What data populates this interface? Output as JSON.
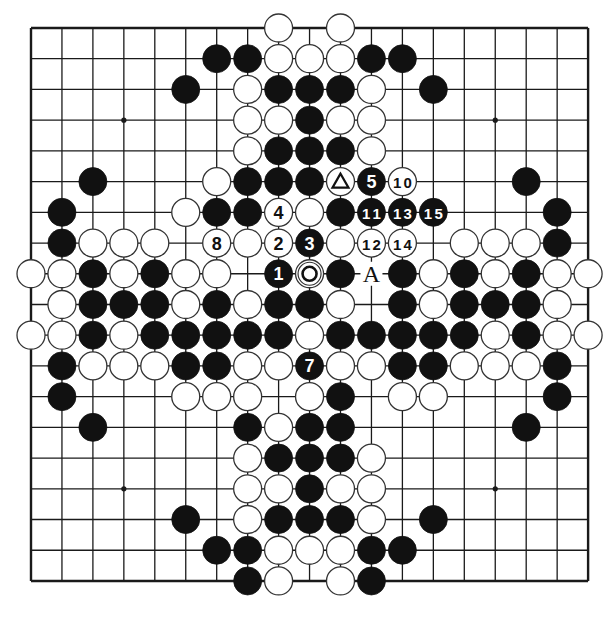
{
  "diagram": {
    "size": 19,
    "origin": {
      "x": 31,
      "y": 28
    },
    "step": {
      "x": 30.95,
      "y": 30.72
    },
    "stone_radius": 14,
    "colors": {
      "line": "#1a1a1a",
      "black": "#111111",
      "white": "#ffffff",
      "paper": "#ffffff"
    },
    "hoshi": [
      [
        3,
        3
      ],
      [
        3,
        9
      ],
      [
        3,
        15
      ],
      [
        9,
        3
      ],
      [
        9,
        9
      ],
      [
        9,
        15
      ],
      [
        15,
        3
      ],
      [
        15,
        9
      ],
      [
        15,
        15
      ]
    ],
    "rows": [
      "........W.W........",
      "......BBWWWBB......",
      ".....B.WBBBW.B.....",
      ".......WWBWW.......",
      ".......WBBBW.......",
      "..B...WBBBWBW...B..",
      ".B...WBBWWBBBB...B.",
      ".BWWW.WWWBWWW.WWWB.",
      "WWBWBWW.BWB.BWBWBWW",
      ".WBBBWBWBBW.BWBBBW.",
      "WWBWBBBBBWBBBBBWBWW",
      ".BWWWBBWWBWWBBWWWB.",
      ".B...WWW.WB.WW...B.",
      "..B....BWBB.....B..",
      ".......WBBBW.......",
      ".......WWBWW.......",
      ".....B.WBBBW.B.....",
      "......BBWWWBB......",
      ".......BW.WB......."
    ],
    "numbered_moves": [
      {
        "number": "1",
        "color": "black",
        "row": 8,
        "col": 8
      },
      {
        "number": "2",
        "color": "white",
        "row": 7,
        "col": 8
      },
      {
        "number": "3",
        "color": "black",
        "row": 7,
        "col": 9
      },
      {
        "number": "4",
        "color": "white",
        "row": 6,
        "col": 8
      },
      {
        "number": "5",
        "color": "black",
        "row": 5,
        "col": 11
      },
      {
        "number": "7",
        "color": "black",
        "row": 11,
        "col": 9
      },
      {
        "number": "8",
        "color": "white",
        "row": 7,
        "col": 6
      },
      {
        "number": "10",
        "color": "white",
        "row": 5,
        "col": 12
      },
      {
        "number": "11",
        "color": "black",
        "row": 6,
        "col": 11
      },
      {
        "number": "12",
        "color": "white",
        "row": 7,
        "col": 11
      },
      {
        "number": "13",
        "color": "black",
        "row": 6,
        "col": 12
      },
      {
        "number": "14",
        "color": "white",
        "row": 7,
        "col": 12
      },
      {
        "number": "15",
        "color": "black",
        "row": 6,
        "col": 13
      }
    ],
    "markers": [
      {
        "type": "triangle",
        "color": "white",
        "row": 5,
        "col": 10
      },
      {
        "type": "circle",
        "color": "white",
        "row": 8,
        "col": 9
      }
    ],
    "labels": [
      {
        "text": "A",
        "row": 8,
        "col": 11
      }
    ]
  }
}
